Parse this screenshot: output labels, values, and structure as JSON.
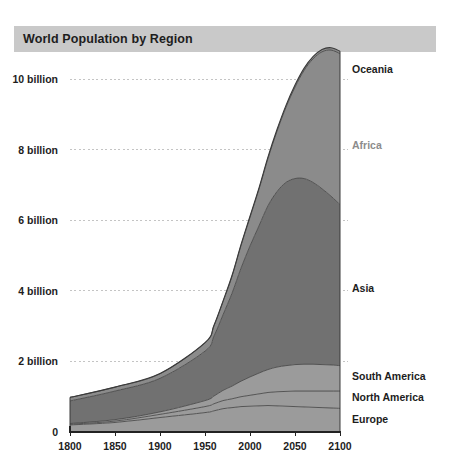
{
  "header": {
    "title": "World Population by Region"
  },
  "chart_data": {
    "type": "area",
    "title": "World Population by Region",
    "xlabel": "",
    "ylabel": "",
    "stacked": true,
    "grid": true,
    "legend_position": "right-inline",
    "xlim": [
      1800,
      2100
    ],
    "ylim": [
      0,
      10.8
    ],
    "xticks": [
      1800,
      1850,
      1900,
      1950,
      2000,
      2050,
      2100
    ],
    "xtick_labels": [
      "1800",
      "1850",
      "1900",
      "1950",
      "2000",
      "2050",
      "2100"
    ],
    "yticks": [
      0,
      2,
      4,
      6,
      8,
      10
    ],
    "ytick_labels": [
      "0",
      "2 billion",
      "4 billion",
      "6 billion",
      "8 billion",
      "10 billion"
    ],
    "x": [
      1800,
      1850,
      1900,
      1950,
      1960,
      1970,
      1980,
      1990,
      2000,
      2010,
      2020,
      2030,
      2040,
      2050,
      2060,
      2070,
      2080,
      2090,
      2100
    ],
    "series": [
      {
        "name": "Europe",
        "color": "#9b9b9b",
        "label_color": "#1d1d1d",
        "values": [
          0.2,
          0.27,
          0.41,
          0.55,
          0.6,
          0.66,
          0.69,
          0.72,
          0.73,
          0.74,
          0.75,
          0.74,
          0.73,
          0.72,
          0.71,
          0.7,
          0.69,
          0.68,
          0.67
        ]
      },
      {
        "name": "North America",
        "color": "#9b9b9b",
        "label_color": "#1d1d1d",
        "values": [
          0.02,
          0.04,
          0.09,
          0.17,
          0.2,
          0.23,
          0.25,
          0.28,
          0.31,
          0.34,
          0.37,
          0.4,
          0.42,
          0.44,
          0.45,
          0.46,
          0.47,
          0.48,
          0.49
        ]
      },
      {
        "name": "South America",
        "color": "#9b9b9b",
        "label_color": "#1d1d1d",
        "values": [
          0.02,
          0.04,
          0.07,
          0.17,
          0.22,
          0.29,
          0.36,
          0.44,
          0.52,
          0.59,
          0.65,
          0.7,
          0.73,
          0.75,
          0.76,
          0.76,
          0.75,
          0.74,
          0.72
        ]
      },
      {
        "name": "Asia",
        "color": "#717171",
        "label_color": "#1d1d1d",
        "values": [
          0.64,
          0.81,
          0.95,
          1.4,
          1.7,
          2.14,
          2.63,
          3.2,
          3.71,
          4.17,
          4.64,
          4.97,
          5.19,
          5.27,
          5.26,
          5.15,
          4.98,
          4.78,
          4.56
        ]
      },
      {
        "name": "Africa",
        "color": "#8b8b8b",
        "label_color": "#8c8c8c",
        "values": [
          0.1,
          0.11,
          0.13,
          0.23,
          0.29,
          0.37,
          0.48,
          0.64,
          0.81,
          1.04,
          1.34,
          1.71,
          2.13,
          2.59,
          3.06,
          3.5,
          3.88,
          4.14,
          4.28
        ]
      },
      {
        "name": "Oceania",
        "color": "#8b8b8b",
        "label_color": "#1d1d1d",
        "values": [
          0.002,
          0.002,
          0.006,
          0.013,
          0.016,
          0.019,
          0.023,
          0.027,
          0.031,
          0.037,
          0.043,
          0.048,
          0.053,
          0.057,
          0.06,
          0.063,
          0.065,
          0.067,
          0.068
        ]
      }
    ],
    "series_labels": [
      {
        "name": "Oceania",
        "y_px": 69,
        "muted": false
      },
      {
        "name": "Africa",
        "y_px": 145,
        "muted": true
      },
      {
        "name": "Asia",
        "y_px": 288,
        "muted": false
      },
      {
        "name": "South America",
        "y_px": 376,
        "muted": false
      },
      {
        "name": "North America",
        "y_px": 397,
        "muted": false
      },
      {
        "name": "Europe",
        "y_px": 419,
        "muted": false
      }
    ]
  },
  "colors": {
    "header_bar": "#c9c9c9",
    "axis": "#222222",
    "grid": "#c4c4c4",
    "band_light": "#9b9b9b",
    "band_mid": "#8b8b8b",
    "band_dark": "#717171",
    "text": "#1d1d1d",
    "text_muted": "#8c8c8c",
    "background": "#ffffff"
  }
}
